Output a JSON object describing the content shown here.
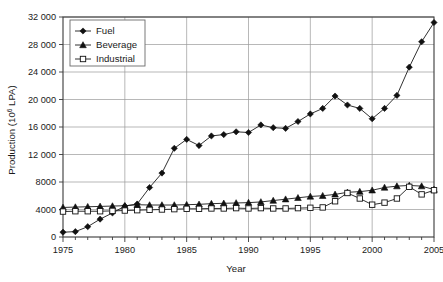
{
  "chart_data": {
    "type": "line",
    "title": "",
    "xlabel": "Year",
    "ylabel": "Production (10⁶ LPA)",
    "ylabel_prefix": "Production (10",
    "ylabel_exponent": "6",
    "ylabel_suffix": " LPA)",
    "xlim": [
      1975,
      2005
    ],
    "ylim": [
      0,
      32000
    ],
    "grid": "horizontal-and-vertical",
    "legend_position": "top-left-inside",
    "x": [
      1975,
      1976,
      1977,
      1978,
      1979,
      1980,
      1981,
      1982,
      1983,
      1984,
      1985,
      1986,
      1987,
      1988,
      1989,
      1990,
      1991,
      1992,
      1993,
      1994,
      1995,
      1996,
      1997,
      1998,
      1999,
      2000,
      2001,
      2002,
      2003,
      2004,
      2005
    ],
    "xticks": [
      1975,
      1980,
      1985,
      1990,
      1995,
      2000,
      2005
    ],
    "xtick_labels": [
      "1975",
      "1980",
      "1985",
      "1990",
      "1995",
      "2000",
      "2005"
    ],
    "xminor_ticks": [
      1976,
      1977,
      1978,
      1979,
      1981,
      1982,
      1983,
      1984,
      1986,
      1987,
      1988,
      1989,
      1991,
      1992,
      1993,
      1994,
      1996,
      1997,
      1998,
      1999,
      2001,
      2002,
      2003,
      2004
    ],
    "yticks": [
      0,
      4000,
      8000,
      12000,
      16000,
      20000,
      24000,
      28000,
      32000
    ],
    "ytick_labels": [
      "0",
      "4000",
      "8000",
      "12 000",
      "16 000",
      "20 000",
      "24 000",
      "28 000",
      "32 000"
    ],
    "series": [
      {
        "name": "Fuel",
        "marker": "filled-diamond",
        "values": [
          700,
          780,
          1500,
          2600,
          3500,
          4500,
          4800,
          7200,
          9300,
          12900,
          14200,
          13300,
          14700,
          14900,
          15300,
          15200,
          16300,
          15900,
          15800,
          16800,
          17900,
          18700,
          20500,
          19200,
          18700,
          17200,
          18700,
          20600,
          24700,
          28400,
          31200
        ]
      },
      {
        "name": "Beverage",
        "marker": "filled-triangle",
        "values": [
          4300,
          4350,
          4400,
          4450,
          4500,
          4550,
          4700,
          4650,
          4650,
          4650,
          4700,
          4750,
          4850,
          4900,
          4950,
          5000,
          5100,
          5300,
          5500,
          5700,
          5900,
          6000,
          6200,
          6500,
          6600,
          6800,
          7200,
          7400,
          7500,
          7400,
          6900
        ]
      },
      {
        "name": "Industrial",
        "marker": "open-square",
        "values": [
          3700,
          3750,
          3750,
          3750,
          3800,
          3850,
          3900,
          3950,
          4000,
          4050,
          4100,
          4100,
          4150,
          4150,
          4200,
          4150,
          4200,
          4150,
          4150,
          4200,
          4250,
          4300,
          5200,
          6400,
          5600,
          4700,
          5000,
          5600,
          7300,
          6200,
          6800
        ]
      }
    ]
  },
  "legend": {
    "items": [
      {
        "label": "Fuel",
        "marker": "filled-diamond"
      },
      {
        "label": "Beverage",
        "marker": "filled-triangle"
      },
      {
        "label": "Industrial",
        "marker": "open-square"
      }
    ]
  },
  "colors": {
    "line": "#1a1a1a",
    "grid": "#9a9a9a",
    "frame": "#3a3a3a",
    "background": "#ffffff"
  }
}
